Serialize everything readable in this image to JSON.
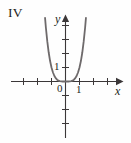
{
  "figure": {
    "panel_label": "IV",
    "background_color": "#fefefe",
    "curve_color": "#6e6a6b",
    "axis_color": "#231f20"
  },
  "axes": {
    "x_label": "x",
    "y_label": "y",
    "origin_label": "0",
    "x_tick_label": "1",
    "y_tick_label": "1"
  },
  "chart_data": {
    "type": "line",
    "title": "IV",
    "xlabel": "x",
    "ylabel": "y",
    "grid": false,
    "legend": null,
    "xlim": [
      -3.6,
      3.4
    ],
    "ylim": [
      -4.2,
      4.6
    ],
    "xticks": [
      -3,
      -2,
      -1,
      0,
      1,
      2,
      3
    ],
    "yticks": [
      -3,
      -2,
      -1,
      0,
      1,
      2,
      3,
      4
    ],
    "xticklabels": [
      "",
      "",
      "",
      "0",
      "1",
      "",
      ""
    ],
    "yticklabels": [
      "",
      "",
      "",
      "",
      "1",
      "",
      "",
      ""
    ],
    "series": [
      {
        "name": "y = x^4",
        "equation": "y = x^4",
        "color": "#6e6a6b",
        "x": [
          -1.46,
          -1.4,
          -1.3,
          -1.2,
          -1.1,
          -1.0,
          -0.9,
          -0.8,
          -0.7,
          -0.6,
          -0.5,
          -0.4,
          -0.3,
          -0.2,
          -0.1,
          0.0,
          0.1,
          0.2,
          0.3,
          0.4,
          0.5,
          0.6,
          0.7,
          0.8,
          0.9,
          1.0,
          1.1,
          1.2,
          1.3,
          1.4,
          1.46
        ],
        "y": [
          4.54,
          3.84,
          2.86,
          2.07,
          1.46,
          1.0,
          0.66,
          0.41,
          0.24,
          0.13,
          0.06,
          0.03,
          0.01,
          0.0016,
          0.0001,
          0.0,
          0.0001,
          0.0016,
          0.01,
          0.03,
          0.06,
          0.13,
          0.24,
          0.41,
          0.66,
          1.0,
          1.46,
          2.07,
          2.86,
          3.84,
          4.54
        ]
      }
    ]
  }
}
